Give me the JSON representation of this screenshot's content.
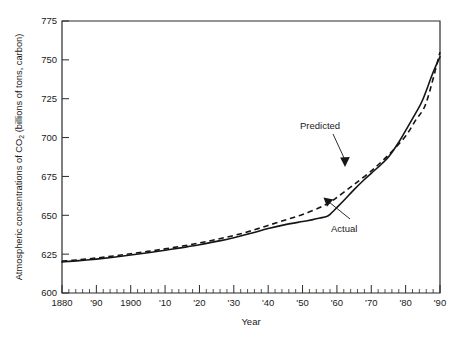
{
  "chart_data": {
    "type": "line",
    "title": "",
    "xlabel": "Year",
    "ylabel": "Atmospheric concentrations of CO2 (billions of tons, carbon)",
    "ylabel_parts": {
      "before": "Atmospheric concentrations of CO",
      "subscript": "2",
      "after": " (billions of tons, carbon)"
    },
    "xlim": [
      1880,
      1990
    ],
    "ylim": [
      600,
      775
    ],
    "grid": false,
    "legend": "none",
    "y_ticks": [
      600,
      625,
      650,
      675,
      700,
      725,
      750,
      775
    ],
    "y_tick_labels": [
      "600",
      "625",
      "650",
      "675",
      "700",
      "725",
      "750",
      "775"
    ],
    "x_ticks": [
      1880,
      1890,
      1900,
      1910,
      1920,
      1930,
      1940,
      1950,
      1960,
      1970,
      1980,
      1990
    ],
    "x_tick_labels": [
      "1880",
      "'90",
      "1900",
      "'10",
      "'20",
      "'30",
      "'40",
      "'50",
      "'60",
      "'70",
      "'80",
      "'90"
    ],
    "x_minor_tick_step": 2,
    "series": [
      {
        "name": "Actual",
        "style": "solid",
        "x": [
          1880,
          1885,
          1890,
          1895,
          1900,
          1905,
          1910,
          1915,
          1920,
          1925,
          1930,
          1935,
          1940,
          1945,
          1950,
          1953,
          1955,
          1957,
          1958,
          1960,
          1962,
          1965,
          1968,
          1970,
          1973,
          1975,
          1978,
          1980,
          1983,
          1985,
          1988,
          1990
        ],
        "values": [
          620.0,
          620.8,
          621.8,
          623.0,
          624.4,
          625.9,
          627.5,
          629.2,
          631.0,
          633.2,
          635.6,
          638.4,
          641.5,
          644.0,
          646.0,
          647.2,
          648.2,
          649.2,
          650.6,
          655.0,
          659.5,
          666.5,
          673.0,
          677.0,
          683.0,
          687.5,
          697.0,
          704.5,
          716.0,
          724.5,
          742.0,
          752.0
        ]
      },
      {
        "name": "Predicted",
        "style": "dashed",
        "x": [
          1880,
          1885,
          1890,
          1895,
          1900,
          1905,
          1910,
          1915,
          1920,
          1925,
          1930,
          1935,
          1940,
          1945,
          1950,
          1955,
          1958,
          1960,
          1963,
          1966,
          1970,
          1973,
          1976,
          1980,
          1983,
          1986,
          1990
        ],
        "values": [
          620.5,
          621.4,
          622.5,
          623.8,
          625.3,
          626.8,
          628.4,
          630.2,
          632.2,
          634.5,
          637.0,
          640.0,
          643.5,
          647.0,
          650.5,
          655.0,
          658.5,
          661.5,
          666.5,
          671.5,
          678.5,
          684.5,
          691.0,
          701.0,
          711.5,
          722.5,
          755.0
        ]
      }
    ],
    "annotations": [
      {
        "id": "predicted-label",
        "text": "Predicted",
        "target_series": "Predicted",
        "target_x": 1962,
        "target_y": 662
      },
      {
        "id": "actual-label",
        "text": "Actual",
        "target_series": "Actual",
        "target_x": 1957,
        "target_y": 650
      }
    ]
  }
}
